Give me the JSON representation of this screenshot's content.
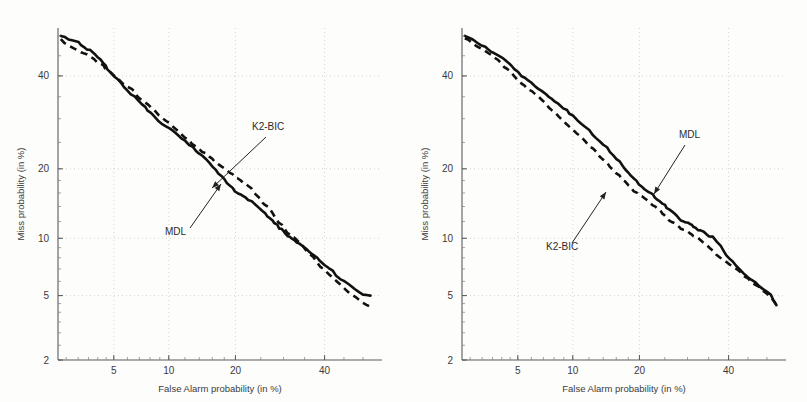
{
  "figure": {
    "background_color": "#fdfdfc",
    "curve_color": "#111111",
    "grid_color": "#c9c9c9",
    "axis_color": "#5a5a5a"
  },
  "panels": [
    {
      "id": "left",
      "name": "det-plot-left",
      "xlabel": "False Alarm probability (in %)",
      "ylabel": "Miss probability (in %)",
      "xticks": [
        "5",
        "10",
        "20",
        "40"
      ],
      "yticks": [
        "40",
        "20",
        "10",
        "5",
        "2"
      ],
      "annotations": [
        {
          "label": "K2-BIC",
          "target_series": "K2-BIC"
        },
        {
          "label": "MDL",
          "target_series": "MDL"
        }
      ]
    },
    {
      "id": "right",
      "name": "det-plot-right",
      "xlabel": "False Alarm probability (in %)",
      "ylabel": "Miss probability (in %)",
      "xticks": [
        "5",
        "10",
        "20",
        "40"
      ],
      "yticks": [
        "40",
        "20",
        "10",
        "5",
        "2"
      ],
      "annotations": [
        {
          "label": "MDL",
          "target_series": "MDL"
        },
        {
          "label": "K2-BIC",
          "target_series": "K2-BIC"
        }
      ]
    }
  ],
  "chart_data": [
    {
      "type": "line",
      "panel": "left",
      "title": "",
      "xlabel": "False Alarm probability (in %)",
      "ylabel": "Miss probability (in %)",
      "scale": "probit (DET)",
      "grid": true,
      "legend": "annotations-with-arrows",
      "xlim": [
        2.2,
        55
      ],
      "ylim": [
        2,
        52
      ],
      "xticks": [
        5,
        10,
        20,
        40
      ],
      "yticks": [
        2,
        5,
        10,
        20,
        40
      ],
      "series": [
        {
          "name": "MDL",
          "style": "solid",
          "points": [
            [
              2.3,
              50.0
            ],
            [
              2.6,
              49.2
            ],
            [
              3.0,
              48.6
            ],
            [
              3.3,
              47.0
            ],
            [
              3.6,
              46.4
            ],
            [
              4.0,
              44.8
            ],
            [
              4.3,
              43.2
            ],
            [
              4.6,
              41.8
            ],
            [
              5.0,
              39.8
            ],
            [
              5.5,
              38.2
            ],
            [
              6.0,
              36.6
            ],
            [
              6.6,
              35.0
            ],
            [
              7.2,
              33.4
            ],
            [
              7.8,
              32.0
            ],
            [
              8.5,
              30.4
            ],
            [
              9.3,
              28.8
            ],
            [
              10.0,
              27.8
            ],
            [
              11.0,
              26.6
            ],
            [
              12.0,
              25.2
            ],
            [
              13.0,
              24.0
            ],
            [
              14.0,
              22.8
            ],
            [
              15.0,
              21.8
            ],
            [
              16.0,
              20.4
            ],
            [
              17.0,
              19.2
            ],
            [
              18.0,
              18.2
            ],
            [
              19.0,
              17.2
            ],
            [
              20.0,
              16.2
            ],
            [
              21.0,
              15.6
            ],
            [
              22.0,
              15.3
            ],
            [
              23.0,
              14.8
            ],
            [
              24.0,
              14.2
            ],
            [
              25.0,
              13.5
            ],
            [
              26.0,
              13.0
            ],
            [
              27.0,
              12.4
            ],
            [
              28.0,
              11.8
            ],
            [
              29.0,
              11.2
            ],
            [
              30.0,
              10.8
            ],
            [
              31.0,
              10.3
            ],
            [
              32.0,
              10.0
            ],
            [
              33.0,
              9.6
            ],
            [
              34.5,
              9.1
            ],
            [
              36.0,
              8.6
            ],
            [
              38.0,
              8.0
            ],
            [
              40.0,
              7.4
            ],
            [
              42.0,
              6.8
            ],
            [
              44.0,
              6.2
            ],
            [
              46.0,
              5.8
            ],
            [
              48.0,
              5.4
            ],
            [
              50.0,
              5.1
            ],
            [
              52.0,
              5.0
            ]
          ]
        },
        {
          "name": "K2-BIC",
          "style": "dashed",
          "points": [
            [
              2.3,
              49.2
            ],
            [
              2.6,
              47.6
            ],
            [
              3.0,
              46.4
            ],
            [
              3.3,
              45.6
            ],
            [
              3.6,
              44.6
            ],
            [
              4.0,
              43.4
            ],
            [
              4.3,
              42.6
            ],
            [
              4.6,
              41.4
            ],
            [
              5.0,
              40.0
            ],
            [
              5.5,
              38.6
            ],
            [
              6.0,
              37.4
            ],
            [
              6.6,
              36.0
            ],
            [
              7.2,
              34.4
            ],
            [
              7.8,
              33.2
            ],
            [
              8.5,
              31.6
            ],
            [
              9.3,
              30.2
            ],
            [
              10.0,
              29.0
            ],
            [
              11.0,
              27.4
            ],
            [
              12.0,
              26.0
            ],
            [
              13.0,
              24.8
            ],
            [
              14.0,
              23.8
            ],
            [
              15.0,
              22.8
            ],
            [
              16.0,
              21.8
            ],
            [
              17.0,
              20.8
            ],
            [
              18.0,
              20.0
            ],
            [
              19.0,
              19.2
            ],
            [
              20.0,
              18.6
            ],
            [
              21.0,
              18.0
            ],
            [
              22.0,
              17.4
            ],
            [
              23.0,
              16.6
            ],
            [
              24.0,
              15.8
            ],
            [
              25.0,
              15.0
            ],
            [
              26.0,
              14.2
            ],
            [
              27.0,
              13.4
            ],
            [
              28.0,
              12.6
            ],
            [
              29.0,
              11.8
            ],
            [
              30.0,
              11.2
            ],
            [
              31.0,
              10.6
            ],
            [
              32.0,
              10.2
            ],
            [
              33.0,
              9.8
            ],
            [
              34.5,
              9.2
            ],
            [
              36.0,
              8.4
            ],
            [
              38.0,
              7.6
            ],
            [
              40.0,
              6.9
            ],
            [
              42.0,
              6.3
            ],
            [
              44.0,
              5.8
            ],
            [
              46.0,
              5.3
            ],
            [
              48.0,
              4.9
            ],
            [
              50.0,
              4.6
            ],
            [
              52.0,
              4.3
            ]
          ]
        }
      ]
    },
    {
      "type": "line",
      "panel": "right",
      "title": "",
      "xlabel": "False Alarm probability (in %)",
      "ylabel": "Miss probability (in %)",
      "scale": "probit (DET)",
      "grid": true,
      "legend": "annotations-with-arrows",
      "xlim": [
        2.2,
        55
      ],
      "ylim": [
        2,
        52
      ],
      "xticks": [
        5,
        10,
        20,
        40
      ],
      "yticks": [
        2,
        5,
        10,
        20,
        40
      ],
      "series": [
        {
          "name": "MDL",
          "style": "solid",
          "points": [
            [
              2.3,
              50.0
            ],
            [
              2.6,
              49.0
            ],
            [
              3.0,
              47.6
            ],
            [
              3.3,
              46.6
            ],
            [
              3.6,
              45.6
            ],
            [
              4.0,
              44.4
            ],
            [
              4.3,
              43.4
            ],
            [
              4.6,
              42.4
            ],
            [
              5.0,
              40.8
            ],
            [
              5.5,
              39.4
            ],
            [
              6.0,
              38.2
            ],
            [
              6.6,
              36.8
            ],
            [
              7.2,
              35.6
            ],
            [
              7.8,
              34.4
            ],
            [
              8.5,
              33.2
            ],
            [
              9.3,
              31.8
            ],
            [
              10.0,
              30.6
            ],
            [
              11.0,
              29.0
            ],
            [
              12.0,
              27.4
            ],
            [
              13.0,
              26.0
            ],
            [
              14.0,
              24.6
            ],
            [
              15.0,
              23.2
            ],
            [
              16.0,
              21.8
            ],
            [
              17.0,
              20.6
            ],
            [
              18.0,
              19.4
            ],
            [
              19.0,
              18.4
            ],
            [
              20.0,
              17.4
            ],
            [
              21.0,
              16.6
            ],
            [
              22.0,
              16.0
            ],
            [
              23.0,
              15.4
            ],
            [
              24.0,
              14.8
            ],
            [
              25.0,
              14.2
            ],
            [
              26.0,
              13.6
            ],
            [
              27.0,
              13.0
            ],
            [
              28.0,
              12.4
            ],
            [
              29.0,
              12.0
            ],
            [
              30.0,
              11.8
            ],
            [
              31.0,
              11.5
            ],
            [
              32.0,
              11.2
            ],
            [
              33.0,
              10.9
            ],
            [
              34.5,
              10.5
            ],
            [
              36.0,
              10.1
            ],
            [
              38.0,
              9.2
            ],
            [
              39.5,
              8.2
            ],
            [
              41.0,
              7.6
            ],
            [
              43.0,
              7.0
            ],
            [
              45.0,
              6.4
            ],
            [
              47.0,
              5.9
            ],
            [
              49.0,
              5.4
            ],
            [
              51.0,
              5.0
            ],
            [
              52.5,
              4.4
            ]
          ]
        },
        {
          "name": "K2-BIC",
          "style": "dashed",
          "points": [
            [
              2.3,
              49.4
            ],
            [
              2.6,
              48.2
            ],
            [
              3.0,
              46.8
            ],
            [
              3.3,
              45.6
            ],
            [
              3.6,
              44.4
            ],
            [
              4.0,
              43.0
            ],
            [
              4.3,
              41.8
            ],
            [
              4.6,
              40.6
            ],
            [
              5.0,
              39.0
            ],
            [
              5.5,
              37.6
            ],
            [
              6.0,
              36.2
            ],
            [
              6.6,
              34.8
            ],
            [
              7.2,
              33.4
            ],
            [
              7.8,
              32.0
            ],
            [
              8.5,
              30.4
            ],
            [
              9.3,
              28.8
            ],
            [
              10.0,
              27.6
            ],
            [
              11.0,
              26.0
            ],
            [
              12.0,
              24.4
            ],
            [
              13.0,
              23.0
            ],
            [
              14.0,
              21.6
            ],
            [
              15.0,
              20.4
            ],
            [
              16.0,
              19.2
            ],
            [
              17.0,
              18.2
            ],
            [
              18.0,
              17.2
            ],
            [
              19.0,
              16.4
            ],
            [
              20.0,
              15.8
            ],
            [
              21.0,
              15.2
            ],
            [
              22.0,
              14.6
            ],
            [
              23.0,
              14.0
            ],
            [
              24.0,
              13.4
            ],
            [
              25.0,
              12.8
            ],
            [
              26.0,
              12.2
            ],
            [
              27.0,
              11.8
            ],
            [
              28.0,
              11.4
            ],
            [
              29.0,
              11.0
            ],
            [
              30.0,
              10.7
            ],
            [
              31.0,
              10.4
            ],
            [
              32.0,
              10.1
            ],
            [
              33.0,
              9.8
            ],
            [
              34.5,
              9.3
            ],
            [
              36.0,
              8.7
            ],
            [
              38.0,
              8.0
            ],
            [
              39.5,
              7.6
            ],
            [
              41.0,
              7.2
            ],
            [
              43.0,
              6.7
            ],
            [
              45.0,
              6.2
            ],
            [
              47.0,
              5.8
            ],
            [
              49.0,
              5.3
            ],
            [
              51.0,
              4.9
            ],
            [
              52.5,
              4.4
            ]
          ]
        }
      ]
    }
  ]
}
